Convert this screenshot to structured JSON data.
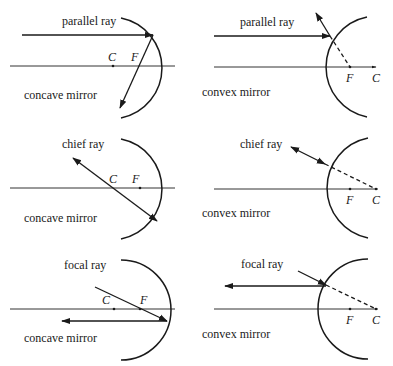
{
  "panels": [
    {
      "id": "concave-parallel",
      "ray_label": "parallel ray",
      "mirror_label": "concave mirror",
      "c_label": "C",
      "f_label": "F"
    },
    {
      "id": "convex-parallel",
      "ray_label": "parallel ray",
      "mirror_label": "convex mirror",
      "c_label": "C",
      "f_label": "F"
    },
    {
      "id": "concave-chief",
      "ray_label": "chief ray",
      "mirror_label": "concave mirror",
      "c_label": "C",
      "f_label": "F"
    },
    {
      "id": "convex-chief",
      "ray_label": "chief ray",
      "mirror_label": "convex mirror",
      "c_label": "C",
      "f_label": "F"
    },
    {
      "id": "concave-focal",
      "ray_label": "focal ray",
      "mirror_label": "concave mirror",
      "c_label": "C",
      "f_label": "F"
    },
    {
      "id": "convex-focal",
      "ray_label": "focal ray",
      "mirror_label": "convex mirror",
      "c_label": "C",
      "f_label": "F"
    }
  ]
}
